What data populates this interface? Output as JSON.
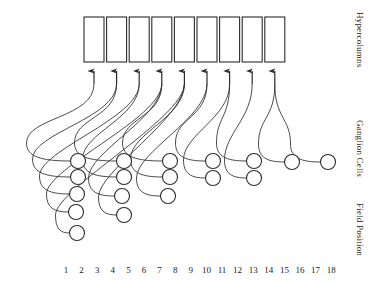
{
  "figure": {
    "type": "diagram",
    "background_color": "#ffffff",
    "stroke_color": "#2b2b2b",
    "rect_fill": "#ffffff"
  },
  "axis_labels": {
    "hypercolumns": "Hypercolumns",
    "ganglion_cells": "Ganglion Cells",
    "field_position": "Field Position"
  },
  "field_positions": {
    "ticks": [
      "1",
      "2",
      "3",
      "4",
      "5",
      "6",
      "7",
      "8",
      "9",
      "10",
      "11",
      "12",
      "13",
      "14",
      "15",
      "16",
      "17",
      "18"
    ],
    "count": 18,
    "first_x": 66,
    "spacing": 15.6,
    "y": 265
  },
  "hypercolumns": {
    "count": 9,
    "label": "Hypercolumns",
    "rect_width": 20,
    "rect_height": 45,
    "rect_gap": 2.6,
    "first_x": 84,
    "top_y": 17,
    "bottom_y": 62
  },
  "arrows": {
    "count": 9,
    "tip_y": 66,
    "tail_y": 84,
    "xs": [
      94,
      116.6,
      139.2,
      161.8,
      184.4,
      207,
      229.6,
      252.2,
      274.8
    ]
  },
  "ganglion_groups": [
    {
      "index": 0,
      "target_arrow": 0,
      "cells": [
        {
          "x": 78,
          "y": 161,
          "field": 1
        },
        {
          "x": 78,
          "y": 177,
          "field": 1
        },
        {
          "x": 77,
          "y": 194,
          "field": 1
        },
        {
          "x": 76,
          "y": 212,
          "field": 1
        },
        {
          "x": 77,
          "y": 233,
          "field": 1
        }
      ]
    },
    {
      "index": 1,
      "target_arrow": 2,
      "cells": [
        {
          "x": 124,
          "y": 161,
          "field": 4
        },
        {
          "x": 124,
          "y": 177,
          "field": 4
        },
        {
          "x": 122,
          "y": 196,
          "field": 4
        },
        {
          "x": 124,
          "y": 215,
          "field": 4
        }
      ]
    },
    {
      "index": 2,
      "target_arrow": 4,
      "cells": [
        {
          "x": 170,
          "y": 161,
          "field": 7
        },
        {
          "x": 170,
          "y": 177,
          "field": 7
        },
        {
          "x": 168,
          "y": 196,
          "field": 7
        }
      ]
    },
    {
      "index": 3,
      "target_arrow": 6,
      "cells": [
        {
          "x": 213,
          "y": 161,
          "field": 10
        },
        {
          "x": 213,
          "y": 178,
          "field": 10
        }
      ]
    },
    {
      "index": 4,
      "target_arrow": 7,
      "cells": [
        {
          "x": 254,
          "y": 161,
          "field": 13
        },
        {
          "x": 254,
          "y": 178,
          "field": 13
        }
      ]
    },
    {
      "index": 5,
      "target_arrow": 8,
      "cells": [
        {
          "x": 292,
          "y": 162,
          "field": 15
        }
      ]
    },
    {
      "index": 6,
      "target_arrow": 8,
      "cells": [
        {
          "x": 328,
          "y": 162,
          "field": 17
        }
      ]
    }
  ],
  "connections": [
    {
      "from_group": 0,
      "from_cell": 0,
      "to_arrow": 0,
      "sweep": 44
    },
    {
      "from_group": 0,
      "from_cell": 1,
      "to_arrow": 1,
      "sweep": 38
    },
    {
      "from_group": 0,
      "from_cell": 2,
      "to_arrow": 2,
      "sweep": 30
    },
    {
      "from_group": 0,
      "from_cell": 3,
      "to_arrow": 3,
      "sweep": 22
    },
    {
      "from_group": 0,
      "from_cell": 4,
      "to_arrow": 4,
      "sweep": 14
    },
    {
      "from_group": 1,
      "from_cell": 0,
      "to_arrow": 1,
      "sweep": 42
    },
    {
      "from_group": 1,
      "from_cell": 1,
      "to_arrow": 2,
      "sweep": 34
    },
    {
      "from_group": 1,
      "from_cell": 2,
      "to_arrow": 3,
      "sweep": 26
    },
    {
      "from_group": 1,
      "from_cell": 3,
      "to_arrow": 4,
      "sweep": 18
    },
    {
      "from_group": 2,
      "from_cell": 0,
      "to_arrow": 3,
      "sweep": 40
    },
    {
      "from_group": 2,
      "from_cell": 1,
      "to_arrow": 4,
      "sweep": 32
    },
    {
      "from_group": 2,
      "from_cell": 2,
      "to_arrow": 5,
      "sweep": 24
    },
    {
      "from_group": 3,
      "from_cell": 0,
      "to_arrow": 5,
      "sweep": 30
    },
    {
      "from_group": 3,
      "from_cell": 1,
      "to_arrow": 6,
      "sweep": 22
    },
    {
      "from_group": 4,
      "from_cell": 0,
      "to_arrow": 6,
      "sweep": 30
    },
    {
      "from_group": 4,
      "from_cell": 1,
      "to_arrow": 7,
      "sweep": 22
    },
    {
      "from_group": 5,
      "from_cell": 0,
      "to_arrow": 8,
      "sweep": 26
    },
    {
      "from_group": 6,
      "from_cell": 0,
      "to_arrow": 8,
      "sweep": 30
    }
  ],
  "cell_radius": 7.5
}
